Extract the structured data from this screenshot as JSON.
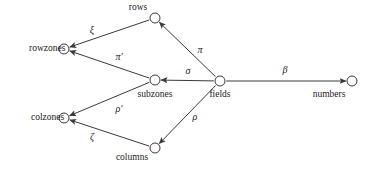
{
  "figure": {
    "type": "directed-graph",
    "background_color": "#ffffff",
    "stroke_color": "#3a3a3a",
    "text_color": "#1a1a1a",
    "node_radius": 5,
    "width": 374,
    "height": 174
  },
  "nodes": [
    {
      "id": "rows",
      "label": "rows",
      "cx": 155,
      "cy": 18,
      "lx": 138,
      "ly": 8,
      "anchor": "above-left"
    },
    {
      "id": "rowzones",
      "label": "rowzones",
      "cx": 64,
      "cy": 49,
      "lx": 29,
      "ly": 49,
      "anchor": "left"
    },
    {
      "id": "subzones",
      "label": "subzones",
      "cx": 155,
      "cy": 80,
      "lx": 155,
      "ly": 95,
      "anchor": "below"
    },
    {
      "id": "fields",
      "label": "fields",
      "cx": 220,
      "cy": 81,
      "lx": 220,
      "ly": 95,
      "anchor": "below"
    },
    {
      "id": "colzones",
      "label": "colzones",
      "cx": 64,
      "cy": 118,
      "lx": 31,
      "ly": 118,
      "anchor": "left"
    },
    {
      "id": "columns",
      "label": "columns",
      "cx": 155,
      "cy": 148,
      "lx": 132,
      "ly": 158,
      "anchor": "below-left"
    },
    {
      "id": "numbers",
      "label": "numbers",
      "cx": 352,
      "cy": 81,
      "lx": 329,
      "ly": 95,
      "anchor": "below-left"
    }
  ],
  "edges": [
    {
      "id": "xi",
      "label": "ξ",
      "from": "rows",
      "to": "rowzones",
      "lx": 92,
      "ly": 30
    },
    {
      "id": "pi-prime",
      "label": "π′",
      "from": "subzones",
      "to": "rowzones",
      "lx": 119,
      "ly": 57
    },
    {
      "id": "pi",
      "label": "π",
      "from": "fields",
      "to": "rows",
      "lx": 200,
      "ly": 50
    },
    {
      "id": "sigma",
      "label": "σ",
      "from": "fields",
      "to": "subzones",
      "lx": 188,
      "ly": 71
    },
    {
      "id": "beta",
      "label": "β",
      "from": "fields",
      "to": "numbers",
      "lx": 285,
      "ly": 70
    },
    {
      "id": "rho",
      "label": "ρ",
      "from": "fields",
      "to": "columns",
      "lx": 195,
      "ly": 117
    },
    {
      "id": "rho-prime",
      "label": "ρ′",
      "from": "subzones",
      "to": "colzones",
      "lx": 119,
      "ly": 109
    },
    {
      "id": "zeta",
      "label": "ζ",
      "from": "columns",
      "to": "colzones",
      "lx": 92,
      "ly": 137
    }
  ]
}
